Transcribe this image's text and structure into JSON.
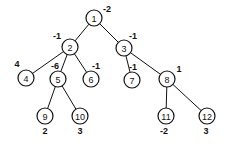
{
  "diagram": {
    "type": "tree",
    "nodes": [
      {
        "id": "1",
        "label": "1",
        "value": "-2",
        "x": 94,
        "y": 18,
        "vx": 107,
        "vy": 9
      },
      {
        "id": "2",
        "label": "2",
        "value": "-1",
        "x": 70,
        "y": 47,
        "vx": 57,
        "vy": 36
      },
      {
        "id": "3",
        "label": "3",
        "value": "-1",
        "x": 124,
        "y": 48,
        "vx": 133,
        "vy": 36
      },
      {
        "id": "4",
        "label": "4",
        "value": "4",
        "x": 26,
        "y": 78,
        "vx": 17,
        "vy": 64
      },
      {
        "id": "5",
        "label": "5",
        "value": "-6",
        "x": 58,
        "y": 79,
        "vx": 55,
        "vy": 66
      },
      {
        "id": "6",
        "label": "6",
        "value": "-1",
        "x": 91,
        "y": 79,
        "vx": 96,
        "vy": 66
      },
      {
        "id": "7",
        "label": "7",
        "value": "-1",
        "x": 132,
        "y": 80,
        "vx": 133,
        "vy": 67
      },
      {
        "id": "8",
        "label": "8",
        "value": "1",
        "x": 167,
        "y": 79,
        "vx": 179,
        "vy": 69
      },
      {
        "id": "9",
        "label": "9",
        "value": "2",
        "x": 45,
        "y": 116,
        "vx": 45,
        "vy": 131
      },
      {
        "id": "10",
        "label": "10",
        "value": "3",
        "x": 80,
        "y": 116,
        "vx": 80,
        "vy": 131
      },
      {
        "id": "11",
        "label": "11",
        "value": "-2",
        "x": 166,
        "y": 116,
        "vx": 164,
        "vy": 131
      },
      {
        "id": "12",
        "label": "12",
        "value": "3",
        "x": 207,
        "y": 116,
        "vx": 206,
        "vy": 131
      }
    ],
    "edges": [
      {
        "from": "1",
        "to": "2"
      },
      {
        "from": "1",
        "to": "3"
      },
      {
        "from": "2",
        "to": "4"
      },
      {
        "from": "2",
        "to": "5"
      },
      {
        "from": "2",
        "to": "6"
      },
      {
        "from": "3",
        "to": "7"
      },
      {
        "from": "3",
        "to": "8"
      },
      {
        "from": "5",
        "to": "9"
      },
      {
        "from": "5",
        "to": "10"
      },
      {
        "from": "8",
        "to": "11"
      },
      {
        "from": "8",
        "to": "12"
      }
    ],
    "node_radius": 8,
    "stroke_color": "#111111",
    "background": "#ffffff"
  }
}
